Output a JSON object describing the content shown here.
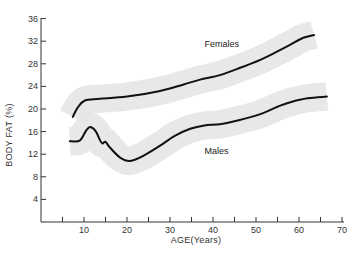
{
  "chart_data": {
    "type": "line",
    "title": "",
    "xlabel": "AGE(Years)",
    "ylabel": "BODY FAT (%)",
    "xlim": [
      0,
      70
    ],
    "ylim": [
      0,
      36
    ],
    "x_ticks": [
      10,
      20,
      30,
      40,
      50,
      60,
      70
    ],
    "x_minor_ticks": [
      5,
      15,
      25,
      35,
      45,
      55,
      65
    ],
    "y_ticks": [
      4,
      8,
      12,
      16,
      20,
      24,
      28,
      32,
      36
    ],
    "grid": false,
    "legend": "inline labels",
    "band_color": "#e6e6e6",
    "line_color": "#111111",
    "band_halfwidth": 2.5,
    "series": [
      {
        "name": "Females",
        "label_pos": {
          "x": 38,
          "y": 31
        },
        "points": [
          [
            7.4,
            18.6
          ],
          [
            8.5,
            20.2
          ],
          [
            10.2,
            21.5
          ],
          [
            13.7,
            21.8
          ],
          [
            20,
            22.2
          ],
          [
            27.7,
            23.2
          ],
          [
            33,
            24.3
          ],
          [
            37,
            25.2
          ],
          [
            41.6,
            26
          ],
          [
            46,
            27.2
          ],
          [
            51,
            28.7
          ],
          [
            55,
            30.2
          ],
          [
            58,
            31.4
          ],
          [
            61,
            32.6
          ],
          [
            63.5,
            33.1
          ]
        ]
      },
      {
        "name": "Males",
        "label_pos": {
          "x": 38,
          "y": 12
        },
        "points": [
          [
            6.7,
            14.3
          ],
          [
            9,
            14.4
          ],
          [
            10.5,
            16.2
          ],
          [
            11.5,
            16.8
          ],
          [
            12.8,
            16.0
          ],
          [
            13.7,
            14.5
          ],
          [
            14.3,
            13.9
          ],
          [
            15.0,
            14.2
          ],
          [
            16,
            13.2
          ],
          [
            18.4,
            11.4
          ],
          [
            20.7,
            10.8
          ],
          [
            24,
            11.8
          ],
          [
            27.7,
            13.5
          ],
          [
            31,
            15.2
          ],
          [
            34.7,
            16.5
          ],
          [
            38,
            17.1
          ],
          [
            41.6,
            17.3
          ],
          [
            46,
            18.0
          ],
          [
            51,
            19.1
          ],
          [
            55,
            20.4
          ],
          [
            58,
            21.2
          ],
          [
            62,
            21.9
          ],
          [
            66.5,
            22.2
          ]
        ]
      }
    ]
  }
}
